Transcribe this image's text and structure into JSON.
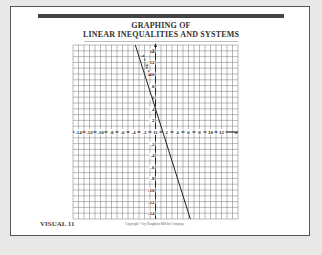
{
  "title": {
    "line1": "GRAPHING OF",
    "line2": "LINEAR INEQUALITIES AND SYSTEMS"
  },
  "footer": {
    "visual_label": "VISUAL 11",
    "copyright": "Copyright © by Houghton Mifflin Company."
  },
  "graph": {
    "x_axis_label": "x",
    "y_axis_label": "y",
    "x_ticks": [
      "-14",
      "-12",
      "-10",
      "-8",
      "-6",
      "-4",
      "-2",
      "O",
      "2",
      "4",
      "6",
      "8",
      "10",
      "12"
    ],
    "y_ticks": [
      "14",
      "12",
      "10",
      "8",
      "6",
      "4",
      "2",
      "-2",
      "-4",
      "-6",
      "-8",
      "-10",
      "-12",
      "-14"
    ],
    "line_label": "y = -3x + 4",
    "line": {
      "slope": -3,
      "intercept": 4
    }
  },
  "chart_data": {
    "type": "line",
    "xlabel": "x",
    "ylabel": "y",
    "xlim": [
      -15,
      15
    ],
    "ylim": [
      -15,
      15
    ],
    "grid": true,
    "series": [
      {
        "name": "y = -3x + 4",
        "x": [
          -3.67,
          6.33
        ],
        "y": [
          15,
          -15
        ]
      }
    ]
  }
}
